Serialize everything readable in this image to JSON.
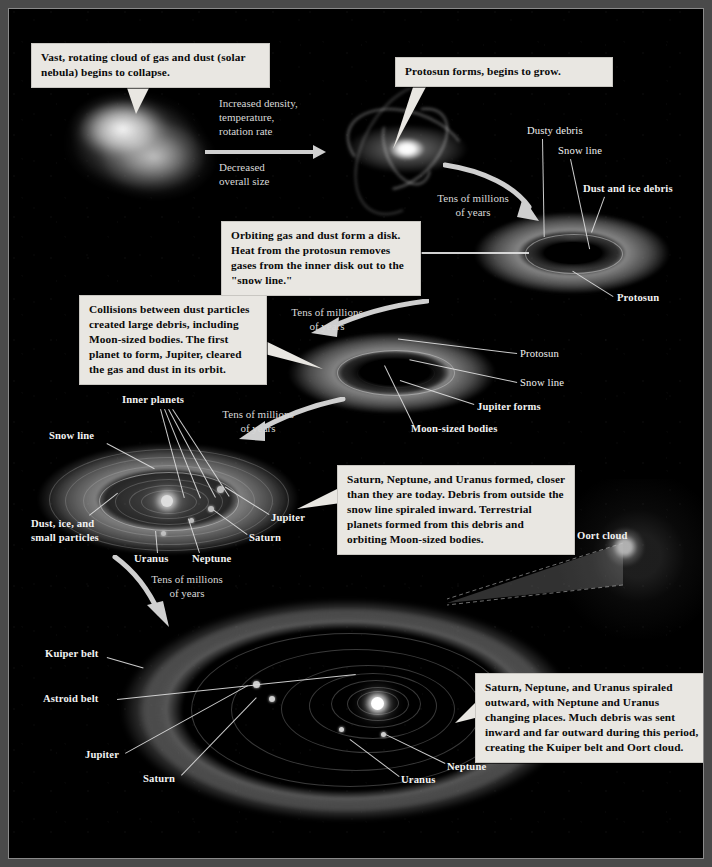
{
  "diagram": {
    "background_color": "#000000",
    "callout_bg": "#e9e7e2",
    "label_color": "#f2f2f2"
  },
  "callouts": [
    {
      "id": "nebula-collapse",
      "text": "Vast, rotating cloud of gas and dust (solar nebula) begins to collapse."
    },
    {
      "id": "protosun-forms",
      "text": "Protosun forms, begins to grow."
    },
    {
      "id": "disk-forms",
      "text": "Orbiting gas and dust form a disk.  Heat from the protosun removes gases from the inner disk out to the \"snow line.\""
    },
    {
      "id": "collisions",
      "text": "Collisions between dust particles created large debris, including Moon-sized bodies.  The first planet to form, Jupiter, cleared the gas and dust in its orbit."
    },
    {
      "id": "outer-planets-form",
      "text": "Saturn, Neptune, and Uranus formed, closer than they are today.  Debris from outside the snow line spiraled inward.  Terrestrial planets formed from this debris and orbiting Moon-sized bodies."
    },
    {
      "id": "spiraled-outward",
      "text": "Saturn, Neptune, and Uranus spiraled outward, with Neptune and Uranus changing places.  Much debris was sent inward and far outward during this period, creating the Kuiper belt and Oort cloud."
    }
  ],
  "process_labels": [
    {
      "id": "increased",
      "text": "Increased density,\ntemperature,\nrotation rate",
      "line1": "Increased density,",
      "line2": "temperature,",
      "line3": "rotation rate"
    },
    {
      "id": "decreased",
      "line1": "Decreased",
      "line2": "overall size"
    },
    {
      "id": "time-1",
      "line1": "Tens of millions",
      "line2": "of years"
    },
    {
      "id": "time-2",
      "line1": "Tens of millions",
      "line2": "of years"
    },
    {
      "id": "time-3",
      "line1": "Tens of millions",
      "line2": "of years"
    },
    {
      "id": "time-4",
      "line1": "Tens of millions",
      "line2": "of years"
    }
  ],
  "stage2_labels": [
    {
      "id": "dusty-debris",
      "text": "Dusty debris",
      "bold": false
    },
    {
      "id": "snow-line-2",
      "text": "Snow line",
      "bold": false
    },
    {
      "id": "dust-ice-debris",
      "text": "Dust and ice debris",
      "bold": true
    },
    {
      "id": "protosun-2",
      "text": "Protosun",
      "bold": true
    }
  ],
  "stage3_labels": [
    {
      "id": "protosun-3",
      "text": "Protosun",
      "bold": false
    },
    {
      "id": "snow-line-3",
      "text": "Snow line",
      "bold": false
    },
    {
      "id": "jupiter-forms",
      "text": "Jupiter forms",
      "bold": true
    },
    {
      "id": "moon-sized-bodies",
      "text": "Moon-sized bodies",
      "bold": true
    }
  ],
  "stage4_labels": [
    {
      "id": "inner-planets",
      "text": "Inner planets",
      "bold": true
    },
    {
      "id": "snow-line-4",
      "text": "Snow line",
      "bold": false
    },
    {
      "id": "dust-ice-small",
      "line1": "Dust, ice, and",
      "line2": "small particles",
      "bold": true
    },
    {
      "id": "jupiter-4",
      "text": "Jupiter",
      "bold": true
    },
    {
      "id": "saturn-4",
      "text": "Saturn",
      "bold": true
    },
    {
      "id": "neptune-4",
      "text": "Neptune",
      "bold": true
    },
    {
      "id": "uranus-4",
      "text": "Uranus",
      "bold": true
    },
    {
      "id": "oort-cloud",
      "text": "Oort cloud",
      "bold": true
    }
  ],
  "stage5_labels": [
    {
      "id": "kuiper-belt",
      "text": "Kuiper belt",
      "bold": true
    },
    {
      "id": "astroid-belt",
      "text": "Astroid belt",
      "bold": true
    },
    {
      "id": "jupiter-5",
      "text": "Jupiter",
      "bold": true
    },
    {
      "id": "saturn-5",
      "text": "Saturn",
      "bold": true
    },
    {
      "id": "uranus-5",
      "text": "Uranus",
      "bold": true
    },
    {
      "id": "neptune-5",
      "text": "Neptune",
      "bold": true
    }
  ]
}
